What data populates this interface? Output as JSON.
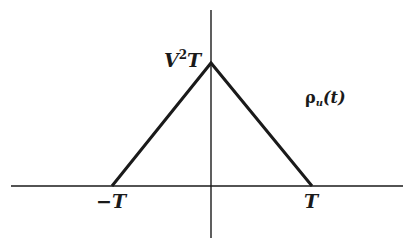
{
  "figure": {
    "colors": {
      "background": "#ffffff",
      "ink": "#1a1a1a"
    },
    "axes": {
      "horizontal": {
        "x1": 11,
        "y": 186,
        "x2": 403
      },
      "vertical": {
        "x": 211,
        "y1": 10,
        "y2": 238
      }
    },
    "triangle": {
      "left": {
        "x": 112,
        "y": 186
      },
      "apex": {
        "x": 211,
        "y": 63
      },
      "right": {
        "x": 312,
        "y": 186
      }
    },
    "labels": {
      "apex_base": "V",
      "apex_exp": "2",
      "apex_tail": "T",
      "function_symbol": "ρ",
      "function_subscript": "u",
      "function_arg": "(t)",
      "neg_t": "−T",
      "pos_t": "T"
    }
  }
}
